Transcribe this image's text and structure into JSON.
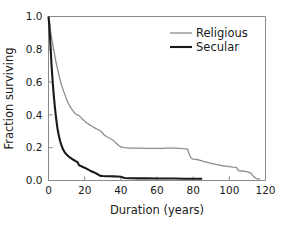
{
  "chart_data": {
    "type": "line",
    "title": "",
    "xlabel": "Duration (years)",
    "ylabel": "Fraction surviving",
    "xlim": [
      0,
      120
    ],
    "ylim": [
      0.0,
      1.0
    ],
    "xticks": [
      0,
      20,
      40,
      60,
      80,
      100,
      120
    ],
    "xtick_labels": [
      "0",
      "20",
      "40",
      "60",
      "80",
      "100",
      "120"
    ],
    "yticks": [
      0.0,
      0.2,
      0.4,
      0.6,
      0.8,
      1.0
    ],
    "ytick_labels": [
      "0.0",
      "0.2",
      "0.4",
      "0.6",
      "0.8",
      "1.0"
    ],
    "grid": false,
    "legend_position": "upper right",
    "series": [
      {
        "name": "Religious",
        "color": "#8c8c8c",
        "line_width": 1.3,
        "points": [
          [
            0,
            1.0
          ],
          [
            0.5,
            0.97
          ],
          [
            1,
            0.92
          ],
          [
            2,
            0.85
          ],
          [
            3,
            0.79
          ],
          [
            4,
            0.73
          ],
          [
            5,
            0.68
          ],
          [
            6,
            0.63
          ],
          [
            7,
            0.59
          ],
          [
            8,
            0.555
          ],
          [
            9,
            0.525
          ],
          [
            10,
            0.495
          ],
          [
            11,
            0.47
          ],
          [
            12,
            0.45
          ],
          [
            13,
            0.432
          ],
          [
            14,
            0.418
          ],
          [
            15,
            0.405
          ],
          [
            16,
            0.4
          ],
          [
            17,
            0.395
          ],
          [
            18,
            0.385
          ],
          [
            19,
            0.372
          ],
          [
            20,
            0.362
          ],
          [
            21,
            0.352
          ],
          [
            22,
            0.345
          ],
          [
            23,
            0.338
          ],
          [
            24,
            0.332
          ],
          [
            25,
            0.325
          ],
          [
            26,
            0.318
          ],
          [
            27,
            0.312
          ],
          [
            28,
            0.308
          ],
          [
            29,
            0.3
          ],
          [
            30,
            0.288
          ],
          [
            31,
            0.275
          ],
          [
            32,
            0.268
          ],
          [
            33,
            0.262
          ],
          [
            34,
            0.256
          ],
          [
            35,
            0.25
          ],
          [
            36,
            0.243
          ],
          [
            37,
            0.232
          ],
          [
            38,
            0.222
          ],
          [
            39,
            0.212
          ],
          [
            40,
            0.205
          ],
          [
            42,
            0.2
          ],
          [
            45,
            0.198
          ],
          [
            50,
            0.197
          ],
          [
            55,
            0.196
          ],
          [
            60,
            0.196
          ],
          [
            63,
            0.196
          ],
          [
            65,
            0.198
          ],
          [
            68,
            0.198
          ],
          [
            70,
            0.197
          ],
          [
            72,
            0.196
          ],
          [
            74,
            0.194
          ],
          [
            76,
            0.193
          ],
          [
            77,
            0.19
          ],
          [
            78,
            0.155
          ],
          [
            79,
            0.135
          ],
          [
            80,
            0.13
          ],
          [
            82,
            0.128
          ],
          [
            84,
            0.122
          ],
          [
            86,
            0.115
          ],
          [
            88,
            0.11
          ],
          [
            90,
            0.105
          ],
          [
            92,
            0.1
          ],
          [
            94,
            0.095
          ],
          [
            96,
            0.09
          ],
          [
            98,
            0.088
          ],
          [
            100,
            0.085
          ],
          [
            102,
            0.082
          ],
          [
            104,
            0.08
          ],
          [
            105,
            0.06
          ],
          [
            107,
            0.058
          ],
          [
            109,
            0.055
          ],
          [
            110,
            0.052
          ],
          [
            112,
            0.045
          ],
          [
            113,
            0.03
          ],
          [
            114,
            0.018
          ],
          [
            115,
            0.012
          ],
          [
            116,
            0.01
          ],
          [
            117,
            0.008
          ]
        ]
      },
      {
        "name": "Secular",
        "color": "#1a1a1a",
        "line_width": 2.1,
        "points": [
          [
            0,
            1.0
          ],
          [
            0.4,
            0.95
          ],
          [
            0.8,
            0.88
          ],
          [
            1.2,
            0.8
          ],
          [
            1.6,
            0.72
          ],
          [
            2,
            0.65
          ],
          [
            2.5,
            0.575
          ],
          [
            3,
            0.51
          ],
          [
            3.5,
            0.45
          ],
          [
            4,
            0.4
          ],
          [
            4.5,
            0.355
          ],
          [
            5,
            0.315
          ],
          [
            5.5,
            0.285
          ],
          [
            6,
            0.26
          ],
          [
            6.5,
            0.238
          ],
          [
            7,
            0.22
          ],
          [
            7.5,
            0.205
          ],
          [
            8,
            0.19
          ],
          [
            9,
            0.172
          ],
          [
            10,
            0.158
          ],
          [
            11,
            0.148
          ],
          [
            12,
            0.14
          ],
          [
            13,
            0.132
          ],
          [
            14,
            0.125
          ],
          [
            15,
            0.118
          ],
          [
            16,
            0.112
          ],
          [
            17,
            0.092
          ],
          [
            18,
            0.088
          ],
          [
            19,
            0.082
          ],
          [
            20,
            0.078
          ],
          [
            21,
            0.072
          ],
          [
            22,
            0.066
          ],
          [
            23,
            0.06
          ],
          [
            24,
            0.055
          ],
          [
            25,
            0.05
          ],
          [
            26,
            0.045
          ],
          [
            27,
            0.04
          ],
          [
            28,
            0.032
          ],
          [
            29,
            0.028
          ],
          [
            30,
            0.027
          ],
          [
            32,
            0.026
          ],
          [
            34,
            0.026
          ],
          [
            36,
            0.025
          ],
          [
            38,
            0.024
          ],
          [
            40,
            0.023
          ],
          [
            42,
            0.015
          ],
          [
            45,
            0.014
          ],
          [
            50,
            0.013
          ],
          [
            55,
            0.013
          ],
          [
            60,
            0.012
          ],
          [
            65,
            0.012
          ],
          [
            70,
            0.012
          ],
          [
            75,
            0.011
          ],
          [
            80,
            0.011
          ],
          [
            84,
            0.011
          ],
          [
            85,
            0.011
          ]
        ]
      }
    ],
    "legend": [
      {
        "label": "Religious",
        "color": "#8c8c8c",
        "line_width": 1.3
      },
      {
        "label": "Secular",
        "color": "#1a1a1a",
        "line_width": 2.1
      }
    ]
  }
}
